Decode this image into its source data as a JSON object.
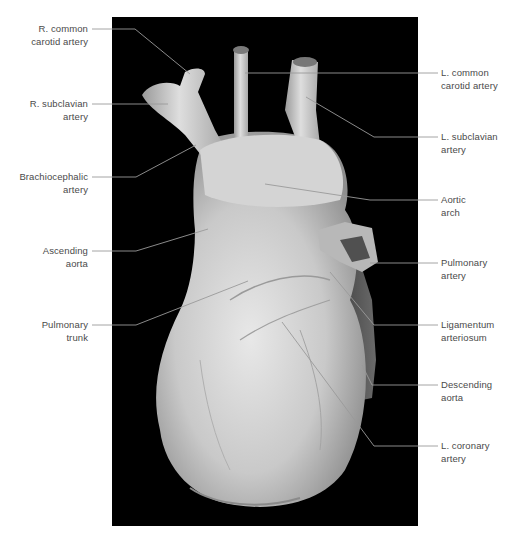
{
  "figure": {
    "background_color": "#000000",
    "label_color": "#4a4a4a",
    "leader_color": "#9a9a9a"
  },
  "labels_left": [
    {
      "id": "r-common-carotid",
      "line1": "R. common",
      "line2": "carotid artery"
    },
    {
      "id": "r-subclavian",
      "line1": "R. subclavian",
      "line2": "artery"
    },
    {
      "id": "brachiocephalic",
      "line1": "Brachiocephalic",
      "line2": "artery"
    },
    {
      "id": "ascending-aorta",
      "line1": "Ascending",
      "line2": "aorta"
    },
    {
      "id": "pulmonary-trunk",
      "line1": "Pulmonary",
      "line2": "trunk"
    }
  ],
  "labels_right": [
    {
      "id": "l-common-carotid",
      "line1": "L. common",
      "line2": "carotid artery"
    },
    {
      "id": "l-subclavian",
      "line1": "L. subclavian",
      "line2": "artery"
    },
    {
      "id": "aortic-arch",
      "line1": "Aortic",
      "line2": "arch"
    },
    {
      "id": "pulmonary-artery",
      "line1": "Pulmonary",
      "line2": "artery"
    },
    {
      "id": "ligamentum-arteriosum",
      "line1": "Ligamentum",
      "line2": "arteriosum"
    },
    {
      "id": "descending-aorta",
      "line1": "Descending",
      "line2": "aorta"
    },
    {
      "id": "l-coronary",
      "line1": "L. coronary",
      "line2": "artery"
    }
  ]
}
